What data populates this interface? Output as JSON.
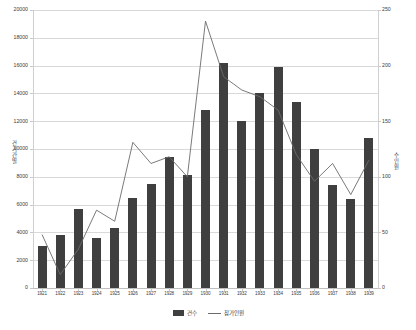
{
  "chart_data": {
    "type": "bar",
    "title": "",
    "xlabel": "",
    "categories": [
      "1921",
      "1922",
      "1923",
      "1924",
      "1925",
      "1926",
      "1927",
      "1928",
      "1929",
      "1930",
      "1931",
      "1932",
      "1933",
      "1934",
      "1935",
      "1936",
      "1937",
      "1938",
      "1939"
    ],
    "series": [
      {
        "name": "건수",
        "type": "bar",
        "axis": "left",
        "color": "#3f3f3f",
        "values": [
          3000,
          3800,
          5700,
          3600,
          4300,
          6500,
          7500,
          9400,
          8100,
          12800,
          16200,
          12000,
          14000,
          15900,
          13400,
          10000,
          7400,
          6400,
          10800
        ]
      },
      {
        "name": "참가인원",
        "type": "line",
        "axis": "right",
        "color": "#6b6b6b",
        "values": [
          48,
          12,
          35,
          70,
          60,
          131,
          112,
          118,
          100,
          240,
          190,
          178,
          172,
          160,
          120,
          96,
          112,
          84,
          115
        ]
      }
    ],
    "left_axis": {
      "label": "건 기간 별",
      "ticks": [
        "0",
        "2000",
        "4000",
        "6000",
        "8000",
        "10000",
        "12000",
        "14000",
        "16000",
        "18000",
        "20000"
      ],
      "min": 0,
      "max": 20000,
      "step": 2000
    },
    "right_axis": {
      "label": "수 인원",
      "ticks": [
        "0",
        "50",
        "100",
        "150",
        "200",
        "250"
      ],
      "min": 0,
      "max": 250,
      "step": 50
    },
    "grid": true,
    "legend_position": "bottom",
    "legend": [
      {
        "label": "건수",
        "marker": "square"
      },
      {
        "label": "참가인원",
        "marker": "line"
      }
    ]
  }
}
